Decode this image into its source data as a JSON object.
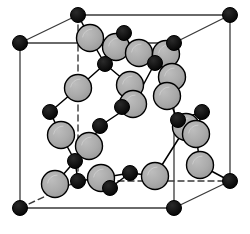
{
  "figure": {
    "type": "crystal-lattice-diagram",
    "width": 250,
    "height": 234,
    "background_color": "#ffffff"
  },
  "style": {
    "large_atom_fill": "#a8a8a8",
    "large_atom_stroke": "#000000",
    "large_atom_radius": 13.5,
    "large_atom_stroke_width": 1.4,
    "small_atom_fill": "#000000",
    "small_atom_stroke": "#000000",
    "small_atom_radius": 7.5,
    "cell_edge_color": "#3a3a3a",
    "cell_edge_width": 1.3,
    "hidden_edge_color": "#3a3a3a",
    "hidden_edge_width": 1.4,
    "hidden_edge_dash": "6,4",
    "bond_color": "#000000",
    "bond_width": 1.5,
    "highlight_color": "#c8c8c8"
  },
  "cell": {
    "label": "cubic-unit-cell",
    "corners": {
      "front_top_left": [
        20,
        43
      ],
      "front_top_right": [
        174,
        43
      ],
      "front_bottom_left": [
        20,
        208
      ],
      "front_bottom_right": [
        174,
        208
      ],
      "back_top_left": [
        78,
        15
      ],
      "back_top_right": [
        230,
        15
      ],
      "back_bottom_left": [
        78,
        181
      ],
      "back_bottom_right": [
        230,
        181
      ]
    },
    "solid_edges": [
      [
        "front_top_left",
        "front_top_right"
      ],
      [
        "front_top_left",
        "front_bottom_left"
      ],
      [
        "front_bottom_left",
        "front_bottom_right"
      ],
      [
        "front_top_right",
        "front_bottom_right"
      ],
      [
        "back_top_left",
        "back_top_right"
      ],
      [
        "back_top_right",
        "back_bottom_right"
      ],
      [
        "front_top_left",
        "back_top_left"
      ],
      [
        "front_top_right",
        "back_top_right"
      ],
      [
        "front_bottom_right",
        "back_bottom_right"
      ]
    ],
    "dashed_edges": [
      [
        "back_top_left",
        "back_bottom_left"
      ],
      [
        "back_bottom_left",
        "back_bottom_right"
      ],
      [
        "front_bottom_left",
        "back_bottom_left"
      ]
    ]
  },
  "atoms": {
    "corner_atoms": {
      "name": "corner-atom",
      "kind": "small-black",
      "positions": [
        [
          20,
          43
        ],
        [
          174,
          43
        ],
        [
          20,
          208
        ],
        [
          174,
          208
        ],
        [
          78,
          15
        ],
        [
          230,
          15
        ],
        [
          230,
          181
        ]
      ]
    },
    "small_atoms": {
      "name": "small-black-atom",
      "kind": "small-black",
      "positions": [
        [
          124,
          33
        ],
        [
          105,
          64
        ],
        [
          155,
          63
        ],
        [
          50,
          112
        ],
        [
          202,
          112
        ],
        [
          122,
          107
        ],
        [
          100,
          126
        ],
        [
          178,
          120
        ],
        [
          75,
          161
        ],
        [
          78,
          181
        ],
        [
          110,
          188
        ],
        [
          130,
          173
        ]
      ]
    },
    "large_atoms": {
      "name": "large-gray-atom",
      "kind": "large-gray",
      "positions": [
        [
          90,
          38
        ],
        [
          116,
          47
        ],
        [
          139,
          53
        ],
        [
          166,
          54
        ],
        [
          78,
          88
        ],
        [
          130,
          85
        ],
        [
          172,
          77
        ],
        [
          167,
          96
        ],
        [
          61,
          135
        ],
        [
          89,
          146
        ],
        [
          133,
          104
        ],
        [
          186,
          127
        ],
        [
          196,
          134
        ],
        [
          55,
          184
        ],
        [
          101,
          178
        ],
        [
          155,
          176
        ],
        [
          200,
          165
        ]
      ]
    }
  },
  "bonds": {
    "name": "atomic-bond",
    "segments": [
      [
        [
          78,
          15
        ],
        [
          90,
          38
        ]
      ],
      [
        [
          90,
          38
        ],
        [
          105,
          64
        ]
      ],
      [
        [
          116,
          47
        ],
        [
          124,
          33
        ]
      ],
      [
        [
          105,
          64
        ],
        [
          116,
          47
        ]
      ],
      [
        [
          105,
          64
        ],
        [
          130,
          85
        ]
      ],
      [
        [
          105,
          64
        ],
        [
          78,
          88
        ]
      ],
      [
        [
          139,
          53
        ],
        [
          155,
          63
        ]
      ],
      [
        [
          155,
          63
        ],
        [
          166,
          54
        ]
      ],
      [
        [
          155,
          63
        ],
        [
          172,
          77
        ]
      ],
      [
        [
          155,
          63
        ],
        [
          133,
          104
        ]
      ],
      [
        [
          78,
          88
        ],
        [
          50,
          112
        ]
      ],
      [
        [
          50,
          112
        ],
        [
          61,
          135
        ]
      ],
      [
        [
          130,
          85
        ],
        [
          122,
          107
        ]
      ],
      [
        [
          122,
          107
        ],
        [
          133,
          104
        ]
      ],
      [
        [
          133,
          104
        ],
        [
          100,
          126
        ]
      ],
      [
        [
          100,
          126
        ],
        [
          89,
          146
        ]
      ],
      [
        [
          61,
          135
        ],
        [
          75,
          161
        ]
      ],
      [
        [
          75,
          161
        ],
        [
          89,
          146
        ]
      ],
      [
        [
          75,
          161
        ],
        [
          78,
          181
        ]
      ],
      [
        [
          75,
          161
        ],
        [
          55,
          184
        ]
      ],
      [
        [
          167,
          96
        ],
        [
          178,
          120
        ]
      ],
      [
        [
          178,
          120
        ],
        [
          186,
          127
        ]
      ],
      [
        [
          178,
          120
        ],
        [
          202,
          112
        ]
      ],
      [
        [
          202,
          112
        ],
        [
          196,
          134
        ]
      ],
      [
        [
          186,
          127
        ],
        [
          155,
          176
        ]
      ],
      [
        [
          155,
          176
        ],
        [
          130,
          173
        ]
      ],
      [
        [
          130,
          173
        ],
        [
          101,
          178
        ]
      ],
      [
        [
          101,
          178
        ],
        [
          78,
          181
        ]
      ],
      [
        [
          110,
          188
        ],
        [
          130,
          173
        ]
      ],
      [
        [
          196,
          134
        ],
        [
          200,
          165
        ]
      ],
      [
        [
          200,
          165
        ],
        [
          230,
          181
        ]
      ],
      [
        [
          172,
          77
        ],
        [
          167,
          96
        ]
      ],
      [
        [
          166,
          54
        ],
        [
          174,
          43
        ]
      ],
      [
        [
          116,
          47
        ],
        [
          139,
          53
        ]
      ]
    ]
  }
}
